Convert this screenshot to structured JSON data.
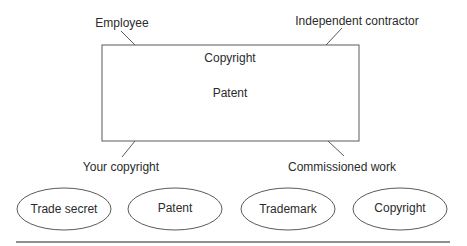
{
  "diagram": {
    "box": {
      "labels": [
        "Copyright",
        "Patent"
      ]
    },
    "callouts": {
      "top_left": "Employee",
      "top_right": "Independent contractor",
      "bottom_left": "Your copyright",
      "bottom_right": "Commissioned work"
    },
    "ellipses": [
      {
        "label": "Trade secret"
      },
      {
        "label": "Patent"
      },
      {
        "label": "Trademark"
      },
      {
        "label": "Copyright"
      }
    ],
    "colors": {
      "stroke": "#5a5a5a",
      "text": "#2b2b2b",
      "background": "#ffffff"
    }
  }
}
